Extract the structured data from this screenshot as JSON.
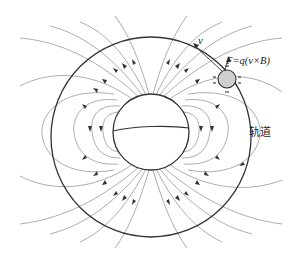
{
  "diagram": {
    "labels": {
      "velocity": "v",
      "force": "F=q(v×B)",
      "orbit": "轨道"
    },
    "colors": {
      "field_line": "#8a8a8a",
      "outline": "#333333",
      "particle_fill": "#cfcfcf",
      "background": "#ffffff"
    },
    "elements": {
      "planet": {
        "cx": 151,
        "cy": 132,
        "r": 38
      },
      "orbit": {
        "cx": 151,
        "cy": 137,
        "r": 100
      },
      "particle": {
        "cx": 227,
        "cy": 79,
        "r": 9
      }
    }
  }
}
